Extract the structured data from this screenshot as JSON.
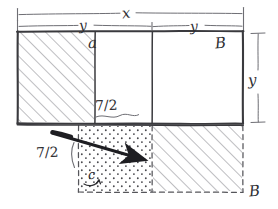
{
  "figure": {
    "background_color": "#ffffff",
    "ink_color": "#3a3a3e",
    "hatch_color": "#8d8d93",
    "stipple_color": "#4a4a4f",
    "arrow_color": "#1e1e22",
    "labels": {
      "total_width": "x",
      "width_left": "y",
      "width_right": "y",
      "height_right": "y",
      "corner_a": "a",
      "corner_b_top": "B",
      "corner_b_bottom": "B",
      "shift_upper": "7/2",
      "shift_lower": "7/2",
      "inner_c": "c"
    },
    "regions": [
      {
        "name": "upper-left-hatched",
        "fill": "hatch",
        "x": 17,
        "y": 31,
        "w": 78,
        "h": 92
      },
      {
        "name": "upper-middle-plain",
        "fill": "none",
        "x": 95,
        "y": 31,
        "w": 57,
        "h": 92
      },
      {
        "name": "upper-right-plain",
        "fill": "none",
        "x": 152,
        "y": 31,
        "w": 91,
        "h": 92
      },
      {
        "name": "lower-stippled",
        "fill": "stipple",
        "x": 78,
        "y": 125,
        "w": 74,
        "h": 67
      },
      {
        "name": "lower-right-hatched",
        "fill": "hatch",
        "x": 152,
        "y": 125,
        "w": 91,
        "h": 67
      }
    ],
    "dimension_lines": [
      {
        "name": "total-width-dimension",
        "x1": 17,
        "x2": 243,
        "y": 14
      },
      {
        "name": "split-width-dimension",
        "x1": 17,
        "x2": 243,
        "y": 26,
        "tick_x": 152
      },
      {
        "name": "height-dimension",
        "x": 258,
        "y1": 34,
        "y2": 122
      }
    ],
    "arrow": {
      "name": "translation-arrow",
      "from_x": 52,
      "from_y": 133,
      "to_x": 148,
      "to_y": 161
    }
  }
}
